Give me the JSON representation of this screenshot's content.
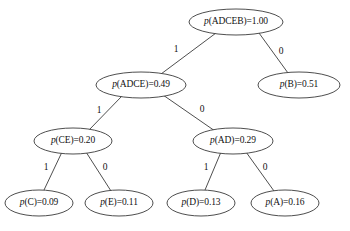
{
  "diagram": {
    "type": "binary-huffman-tree",
    "nodes": [
      {
        "id": "root",
        "prefix": "p",
        "symbols": "(ADCEB)=",
        "value": "1.00",
        "label": "p(ADCEB)=1.00",
        "cx": 236,
        "cy": 22,
        "rx": 47,
        "ry": 13
      },
      {
        "id": "adce",
        "prefix": "p",
        "symbols": "(ADCE)=",
        "value": "0.49",
        "label": "p(ADCE)=0.49",
        "cx": 141,
        "cy": 85,
        "rx": 45,
        "ry": 13
      },
      {
        "id": "b",
        "prefix": "p",
        "symbols": "(B)=",
        "value": "0.51",
        "label": "p(B)=0.51",
        "cx": 299,
        "cy": 85,
        "rx": 41,
        "ry": 13
      },
      {
        "id": "ce",
        "prefix": "p",
        "symbols": "(CE)=",
        "value": "0.20",
        "label": "p(CE)=0.20",
        "cx": 73,
        "cy": 141,
        "rx": 39,
        "ry": 13
      },
      {
        "id": "ad",
        "prefix": "p",
        "symbols": "(AD)=",
        "value": "0.29",
        "label": "p(AD)=0.29",
        "cx": 233,
        "cy": 141,
        "rx": 40,
        "ry": 13
      },
      {
        "id": "c",
        "prefix": "p",
        "symbols": "(C)=",
        "value": "0.09",
        "label": "p(C)=0.09",
        "cx": 39,
        "cy": 203,
        "rx": 34,
        "ry": 13
      },
      {
        "id": "e",
        "prefix": "p",
        "symbols": "(E)=",
        "value": "0.11",
        "label": "p(E)=0.11",
        "cx": 119,
        "cy": 203,
        "rx": 34,
        "ry": 13
      },
      {
        "id": "d",
        "prefix": "p",
        "symbols": "(D)=",
        "value": "0.13",
        "label": "p(D)=0.13",
        "cx": 201,
        "cy": 203,
        "rx": 34,
        "ry": 13
      },
      {
        "id": "a",
        "prefix": "p",
        "symbols": "(A)=",
        "value": "0.16",
        "label": "p(A)=0.16",
        "cx": 285,
        "cy": 203,
        "rx": 34,
        "ry": 13
      }
    ],
    "edges": [
      {
        "id": "root-adce",
        "from": "root",
        "to": "adce",
        "bit": "1",
        "x1": 216,
        "y1": 33,
        "x2": 161,
        "y2": 74,
        "lx": 176,
        "ly": 50
      },
      {
        "id": "root-b",
        "from": "root",
        "to": "b",
        "bit": "0",
        "x1": 259,
        "y1": 33,
        "x2": 288,
        "y2": 73,
        "lx": 281,
        "ly": 52
      },
      {
        "id": "adce-ce",
        "from": "adce",
        "to": "ce",
        "bit": "1",
        "x1": 122,
        "y1": 96,
        "x2": 89,
        "y2": 130,
        "lx": 99,
        "ly": 111
      },
      {
        "id": "adce-ad",
        "from": "adce",
        "to": "ad",
        "bit": "0",
        "x1": 163,
        "y1": 95,
        "x2": 215,
        "y2": 131,
        "lx": 202,
        "ly": 110
      },
      {
        "id": "ce-c",
        "from": "ce",
        "to": "c",
        "bit": "1",
        "x1": 62,
        "y1": 152,
        "x2": 44,
        "y2": 190,
        "lx": 46,
        "ly": 168
      },
      {
        "id": "ce-e",
        "from": "ce",
        "to": "e",
        "bit": "0",
        "x1": 86,
        "y1": 152,
        "x2": 111,
        "y2": 191,
        "lx": 105,
        "ly": 168
      },
      {
        "id": "ad-d",
        "from": "ad",
        "to": "d",
        "bit": "1",
        "x1": 221,
        "y1": 152,
        "x2": 205,
        "y2": 190,
        "lx": 206,
        "ly": 168
      },
      {
        "id": "ad-a",
        "from": "ad",
        "to": "a",
        "bit": "0",
        "x1": 246,
        "y1": 152,
        "x2": 274,
        "y2": 191,
        "lx": 265,
        "ly": 168
      }
    ],
    "colors": {
      "stroke": "#3a3a3a",
      "text": "#111111",
      "background": "#ffffff"
    }
  }
}
